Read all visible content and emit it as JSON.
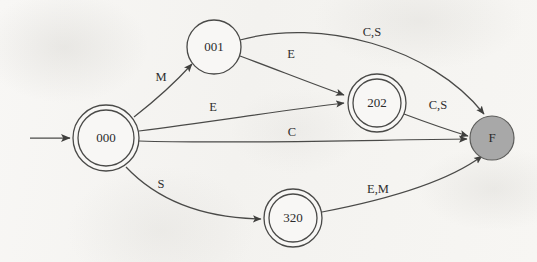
{
  "diagram": {
    "type": "finite-state-machine",
    "background_color": "#f7f6f4",
    "stroke_color": "#4a4a48",
    "accent_fill_color": "#a8a8a8",
    "start_arrow": {
      "name": "start-arrow",
      "from_x": 30,
      "to_x": 70,
      "y": 138
    },
    "states": [
      {
        "id": "s000",
        "label": "000",
        "x": 106,
        "y": 138,
        "r": 33,
        "shape": "double-circle",
        "accepting": true,
        "filled": false,
        "is_start": true
      },
      {
        "id": "s001",
        "label": "001",
        "x": 214,
        "y": 47,
        "r": 27,
        "shape": "circle",
        "accepting": false,
        "filled": false,
        "is_start": false
      },
      {
        "id": "s202",
        "label": "202",
        "x": 377,
        "y": 103,
        "r": 29,
        "shape": "double-circle",
        "accepting": true,
        "filled": false,
        "is_start": false
      },
      {
        "id": "s320",
        "label": "320",
        "x": 293,
        "y": 218,
        "r": 29,
        "shape": "double-circle",
        "accepting": true,
        "filled": false,
        "is_start": false
      },
      {
        "id": "sF",
        "label": "F",
        "x": 492,
        "y": 138,
        "r": 22,
        "shape": "circle",
        "accepting": false,
        "filled": true,
        "is_start": false
      }
    ],
    "transitions": [
      {
        "id": "t-000-001",
        "from": "s000",
        "to": "s001",
        "label": "M",
        "label_x": 161,
        "label_y": 78,
        "path": "M 134,117 C 152,103 172,86 192,64"
      },
      {
        "id": "t-001-202",
        "from": "s001",
        "to": "s202",
        "label": "E",
        "label_x": 291,
        "label_y": 55,
        "path": "M 240,56 C 278,70 310,83 344,95"
      },
      {
        "id": "t-001-F",
        "from": "s001",
        "to": "sF",
        "label": "C,S",
        "label_x": 372,
        "label_y": 33,
        "path": "M 240,40 C 320,18 430,46 484,114"
      },
      {
        "id": "t-000-202",
        "from": "s000",
        "to": "s202",
        "label": "E",
        "label_x": 213,
        "label_y": 108,
        "path": "M 139,131 C 210,122 285,110 344,103"
      },
      {
        "id": "t-000-F",
        "from": "s000",
        "to": "sF",
        "label": "C",
        "label_x": 292,
        "label_y": 133,
        "path": "M 139,141 C 230,144 370,140 467,139"
      },
      {
        "id": "t-202-F",
        "from": "s202",
        "to": "sF",
        "label": "C,S",
        "label_x": 438,
        "label_y": 106,
        "path": "M 404,114 C 428,123 448,130 468,136"
      },
      {
        "id": "t-000-320",
        "from": "s000",
        "to": "s320",
        "label": "S",
        "label_x": 161,
        "label_y": 185,
        "path": "M 126,167 C 160,203 208,218 261,219"
      },
      {
        "id": "t-320-F",
        "from": "s320",
        "to": "sF",
        "label": "E,M",
        "label_x": 378,
        "label_y": 190,
        "path": "M 322,212 C 390,199 450,180 482,156"
      }
    ]
  }
}
